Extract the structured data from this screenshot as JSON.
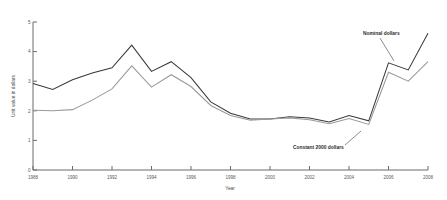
{
  "chart_data": {
    "type": "line",
    "title": "",
    "xlabel": "Year",
    "ylabel": "Unit value in dollars",
    "x": [
      1988,
      1989,
      1990,
      1991,
      1992,
      1993,
      1994,
      1995,
      1996,
      1997,
      1998,
      1999,
      2000,
      2001,
      2002,
      2003,
      2004,
      2005,
      2006,
      2007,
      2008
    ],
    "xlim": [
      1988,
      2008
    ],
    "ylim": [
      0,
      5
    ],
    "grid": false,
    "legend_position": "inline-annotations",
    "xticks": [
      "1988",
      "1990",
      "1992",
      "1994",
      "1996",
      "1998",
      "2000",
      "2002",
      "2004",
      "2006",
      "2008"
    ],
    "xtick_values": [
      1988,
      1990,
      1992,
      1994,
      1996,
      1998,
      2000,
      2002,
      2004,
      2006,
      2008
    ],
    "yticks": [
      "0",
      "1",
      "2",
      "3",
      "4",
      "5"
    ],
    "ytick_values": [
      0,
      1,
      2,
      3,
      4,
      5
    ],
    "series": [
      {
        "name": "Nominal dollars",
        "color": "#3a3a3a",
        "values": [
          2.92,
          2.72,
          3.05,
          3.28,
          3.45,
          4.22,
          3.33,
          3.66,
          3.12,
          2.3,
          1.92,
          1.72,
          1.72,
          1.8,
          1.76,
          1.62,
          1.84,
          1.66,
          3.62,
          3.38,
          4.62
        ]
      },
      {
        "name": "Constant 2000 dollars",
        "color": "#9a9a9a",
        "values": [
          2.02,
          2.0,
          2.04,
          2.36,
          2.74,
          3.52,
          2.8,
          3.22,
          2.82,
          2.18,
          1.84,
          1.68,
          1.72,
          1.76,
          1.7,
          1.56,
          1.74,
          1.54,
          3.3,
          3.0,
          3.66
        ]
      }
    ],
    "annotations": [
      {
        "label": "Nominal dollars",
        "text_x": 363,
        "text_y": 35,
        "leader_from_x": 380,
        "leader_from_y": 38,
        "leader_to_x": 394,
        "leader_to_y": 61
      },
      {
        "label": "Constant 2000 dollars",
        "text_x": 293,
        "text_y": 149,
        "leader_from_x": 345,
        "leader_from_y": 145,
        "leader_to_x": 361,
        "leader_to_y": 131
      }
    ]
  },
  "axes": {
    "y_axis_title": "Unit value in dollars",
    "x_axis_title": "Year"
  }
}
